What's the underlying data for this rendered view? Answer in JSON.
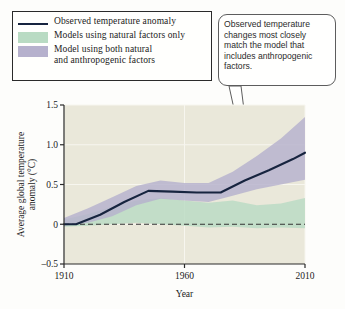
{
  "legend": {
    "items": [
      {
        "label": "Observed temperature anomaly",
        "mark": "line",
        "color": "#17243f"
      },
      {
        "label": "Models using natural factors only",
        "mark": "swatch",
        "color": "#b9dbc3"
      },
      {
        "label": "Model using both natural\nand anthropogenic factors",
        "mark": "swatch",
        "color": "#b6b1cd"
      }
    ]
  },
  "callout": {
    "text": "Observed temperature changes most closely match the model that includes anthropogenic factors."
  },
  "chart_data": {
    "type": "line",
    "title": "",
    "xlabel": "Year",
    "ylabel": "Average global temperature anomaly (°C)",
    "xlim": [
      1910,
      2010
    ],
    "ylim": [
      -0.5,
      1.5
    ],
    "xticks": [
      1910,
      1960,
      2010
    ],
    "xtick_labels": [
      "1910",
      "1960",
      "2010"
    ],
    "yticks": [
      -0.5,
      0,
      0.5,
      1.0,
      1.5
    ],
    "ytick_labels": [
      "–0.5",
      "0",
      "0.5",
      "1.0",
      "1.5"
    ],
    "grid": true,
    "zero_line": 0,
    "legend_position": "above-plot-left",
    "plot_background": "#eae8da",
    "series": [
      {
        "name": "Observed temperature anomaly",
        "type": "line",
        "color": "#17243f",
        "x": [
          1910,
          1915,
          1925,
          1935,
          1945,
          1955,
          1965,
          1975,
          1985,
          1995,
          2005,
          2010
        ],
        "values": [
          0.0,
          0.0,
          0.12,
          0.28,
          0.42,
          0.41,
          0.4,
          0.4,
          0.55,
          0.68,
          0.82,
          0.9
        ]
      },
      {
        "name": "Models using natural factors only",
        "type": "band",
        "color": "#b9dbc3",
        "x": [
          1910,
          1920,
          1930,
          1940,
          1950,
          1960,
          1970,
          1980,
          1990,
          2000,
          2010
        ],
        "lower": [
          -0.03,
          -0.02,
          0.0,
          0.02,
          0.0,
          -0.02,
          -0.04,
          -0.03,
          -0.05,
          -0.04,
          -0.05
        ],
        "upper": [
          0.06,
          0.13,
          0.22,
          0.3,
          0.33,
          0.3,
          0.27,
          0.3,
          0.24,
          0.26,
          0.33
        ]
      },
      {
        "name": "Model using both natural and anthropogenic factors",
        "type": "band",
        "color": "#b6b1cd",
        "x": [
          1910,
          1920,
          1930,
          1940,
          1950,
          1960,
          1970,
          1980,
          1990,
          2000,
          2010
        ],
        "lower": [
          -0.02,
          0.02,
          0.1,
          0.24,
          0.32,
          0.3,
          0.28,
          0.36,
          0.44,
          0.5,
          0.56
        ],
        "upper": [
          0.08,
          0.2,
          0.34,
          0.48,
          0.55,
          0.52,
          0.52,
          0.66,
          0.86,
          1.08,
          1.35
        ]
      }
    ]
  }
}
